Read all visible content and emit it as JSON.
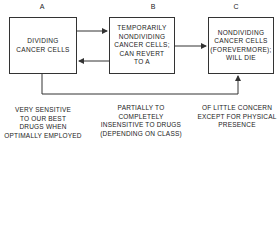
{
  "boxes": [
    {
      "label": "A",
      "text": "DIVIDING\nCANCER CELLS"
    },
    {
      "label": "B",
      "text": "TEMPORARILY\nNONDIVIDING\nCANCER CELLS;\nCAN REVERT\nTO A"
    },
    {
      "label": "C",
      "text": "NONDIVIDING\nCANCER CELLS\n(FOREVERMORE);\nWILL DIE"
    }
  ],
  "captions": [
    "VERY SENSITIVE\nTO OUR BEST\nDRUGS WHEN\nOPTIMALLY EMPLOYED",
    "PARTIALLY TO\nCOMPLETELY\nINSENSITIVE TO DRUGS\n(DEPENDING ON CLASS)",
    "OF LITTLE CONCERN\nEXCEPT FOR PHYSICAL\nPRESENCE"
  ],
  "colors": {
    "line": "#333333",
    "text": "#222222"
  }
}
